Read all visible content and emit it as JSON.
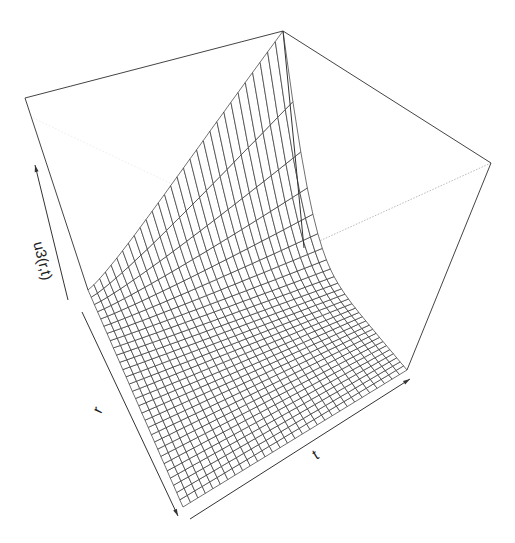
{
  "chart_data": {
    "type": "surface-3d-wireframe",
    "title": "",
    "xlabel": "r",
    "ylabel": "t",
    "zlabel": "u3(r,t)",
    "grid": false,
    "legend": null,
    "mesh": {
      "r_lines": 30,
      "t_lines": 30
    },
    "surface_description": "Surface rises steeply near the r=0 edge (rising with r) and decays exponentially toward ~0 as t increases; flat near-zero floor over most of the domain.",
    "colors": {
      "line": "#333333",
      "box": "#444444",
      "hidden": "#bbbbbb",
      "background": "#ffffff"
    }
  },
  "projection": {
    "origin": [
      88,
      290
    ],
    "r_end": [
      183,
      507
    ],
    "t_end": [
      407,
      370
    ],
    "rt_end": [
      304,
      248
    ],
    "z_top_origin": [
      25,
      98
    ],
    "z_top_r_end": [
      283,
      31
    ],
    "z_top_t_end": [
      491,
      163
    ]
  },
  "axes": {
    "r": {
      "label": "r",
      "from": [
        82,
        312
      ],
      "to": [
        178,
        516
      ],
      "label_pos": [
        102,
        412
      ]
    },
    "t": {
      "label": "t",
      "from": [
        190,
        519
      ],
      "to": [
        410,
        379
      ],
      "label_pos": [
        318,
        459
      ]
    },
    "z": {
      "label": "u3(r,t)",
      "from": [
        68,
        300
      ],
      "to": [
        35,
        165
      ],
      "label_pos": [
        38,
        262
      ]
    }
  }
}
